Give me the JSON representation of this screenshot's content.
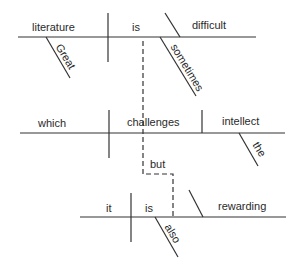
{
  "diagram": {
    "type": "sentence-diagram",
    "sentence": "Great literature is sometimes difficult, which challenges the intellect, but it is also rewarding.",
    "clauses": [
      {
        "subject": "literature",
        "verb": "is",
        "complement": "difficult",
        "modifiers": {
          "subject": "Great",
          "verb": "sometimes"
        }
      },
      {
        "subject": "which",
        "verb": "challenges",
        "object": "intellect",
        "modifiers": {
          "object": "the"
        }
      },
      {
        "subject": "it",
        "verb": "is",
        "complement": "rewarding",
        "modifiers": {
          "verb": "also"
        }
      }
    ],
    "conjunction": "but",
    "line_color": "#333333"
  }
}
